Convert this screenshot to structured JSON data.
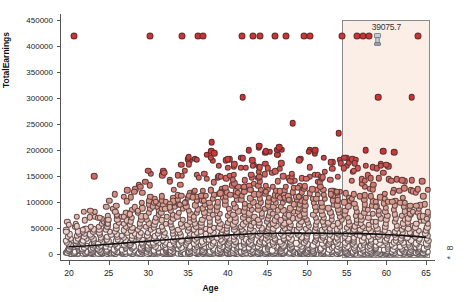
{
  "chart_data": {
    "type": "scatter",
    "title": "",
    "xlabel": "Age",
    "ylabel": "TotalEarnings",
    "xlim": [
      19.0,
      66.0
    ],
    "ylim": [
      -12000,
      462000
    ],
    "xticks": [
      20,
      25,
      30,
      35,
      40,
      45,
      50,
      55,
      60,
      65
    ],
    "xticklabels": [
      "20",
      "25",
      "30",
      "35",
      "40",
      "45",
      "50",
      "55",
      "60",
      "65"
    ],
    "yticks": [
      0,
      50000,
      100000,
      150000,
      200000,
      250000,
      300000,
      350000,
      400000,
      450000
    ],
    "yticklabels": [
      "0",
      "50000",
      "100000",
      "150000",
      "200000",
      "250000",
      "300000",
      "350000",
      "400000",
      "450000"
    ],
    "grid": false,
    "legend_position": "right-margin-clipped",
    "point_color_low": "#ffffff",
    "point_color_mid": "#d89a8d",
    "point_color_high": "#cc3333",
    "point_edge_color": "#4a3535",
    "trend_line_color": "#111111",
    "capped_value": 420000,
    "capped_points": [
      {
        "age": 20.6,
        "earnings": 420000
      },
      {
        "age": 30.2,
        "earnings": 420000
      },
      {
        "age": 34.2,
        "earnings": 420000
      },
      {
        "age": 36.2,
        "earnings": 420000
      },
      {
        "age": 36.9,
        "earnings": 420000
      },
      {
        "age": 41.8,
        "earnings": 420000
      },
      {
        "age": 43.2,
        "earnings": 420000
      },
      {
        "age": 44.1,
        "earnings": 420000
      },
      {
        "age": 46.0,
        "earnings": 420000
      },
      {
        "age": 47.3,
        "earnings": 420000
      },
      {
        "age": 49.6,
        "earnings": 420000
      },
      {
        "age": 50.4,
        "earnings": 420000
      },
      {
        "age": 54.4,
        "earnings": 420000
      },
      {
        "age": 56.3,
        "earnings": 420000
      },
      {
        "age": 57.0,
        "earnings": 420000
      },
      {
        "age": 57.8,
        "earnings": 420000
      },
      {
        "age": 64.0,
        "earnings": 420000
      }
    ],
    "high_outliers": [
      {
        "age": 23.2,
        "earnings": 150000
      },
      {
        "age": 41.9,
        "earnings": 302000
      },
      {
        "age": 59.0,
        "earnings": 302000
      },
      {
        "age": 63.2,
        "earnings": 302000
      },
      {
        "age": 48.2,
        "earnings": 252000
      },
      {
        "age": 54.0,
        "earnings": 232000
      },
      {
        "age": 38.0,
        "earnings": 215000
      },
      {
        "age": 44.0,
        "earnings": 208000
      },
      {
        "age": 46.5,
        "earnings": 205000
      },
      {
        "age": 51.0,
        "earnings": 200000
      },
      {
        "age": 57.4,
        "earnings": 200000
      },
      {
        "age": 59.6,
        "earnings": 198000
      },
      {
        "age": 61.0,
        "earnings": 196000
      },
      {
        "age": 35.1,
        "earnings": 186000
      },
      {
        "age": 40.0,
        "earnings": 182000
      },
      {
        "age": 49.0,
        "earnings": 180000
      },
      {
        "age": 53.0,
        "earnings": 176000
      },
      {
        "age": 56.0,
        "earnings": 174000
      },
      {
        "age": 60.0,
        "earnings": 172000
      },
      {
        "age": 30.0,
        "earnings": 160000
      },
      {
        "age": 32.0,
        "earnings": 156000
      },
      {
        "age": 43.0,
        "earnings": 152000
      },
      {
        "age": 47.0,
        "earnings": 150000
      },
      {
        "age": 52.0,
        "earnings": 148000
      },
      {
        "age": 58.0,
        "earnings": 146000
      },
      {
        "age": 62.0,
        "earnings": 142000
      },
      {
        "age": 64.5,
        "earnings": 140000
      }
    ],
    "trend_line": [
      {
        "age": 20.0,
        "earnings": 13500
      },
      {
        "age": 22.0,
        "earnings": 15000
      },
      {
        "age": 25.0,
        "earnings": 18500
      },
      {
        "age": 28.0,
        "earnings": 22000
      },
      {
        "age": 31.0,
        "earnings": 25500
      },
      {
        "age": 34.0,
        "earnings": 29000
      },
      {
        "age": 37.0,
        "earnings": 32500
      },
      {
        "age": 40.0,
        "earnings": 36000
      },
      {
        "age": 43.0,
        "earnings": 38500
      },
      {
        "age": 46.0,
        "earnings": 39500
      },
      {
        "age": 49.0,
        "earnings": 39800
      },
      {
        "age": 52.0,
        "earnings": 39600
      },
      {
        "age": 55.0,
        "earnings": 39200
      },
      {
        "age": 58.0,
        "earnings": 38200
      },
      {
        "age": 61.0,
        "earnings": 36200
      },
      {
        "age": 63.5,
        "earnings": 33500
      },
      {
        "age": 65.0,
        "earnings": 31500
      }
    ],
    "density_ages": [
      20,
      21,
      22,
      23,
      24,
      25,
      26,
      27,
      28,
      29,
      30,
      31,
      32,
      33,
      34,
      35,
      36,
      37,
      38,
      39,
      40,
      41,
      42,
      43,
      44,
      45,
      46,
      47,
      48,
      49,
      50,
      51,
      52,
      53,
      54,
      55,
      56,
      57,
      58,
      59,
      60,
      61,
      62,
      63,
      64,
      65
    ],
    "density_max_earnings": [
      42000,
      48000,
      54000,
      58000,
      64000,
      72000,
      80000,
      86000,
      92000,
      96000,
      104000,
      108000,
      112000,
      116000,
      122000,
      126000,
      128000,
      130000,
      132000,
      134000,
      136000,
      138000,
      138000,
      140000,
      140000,
      140000,
      138000,
      138000,
      136000,
      136000,
      134000,
      132000,
      132000,
      130000,
      128000,
      126000,
      124000,
      122000,
      120000,
      118000,
      116000,
      112000,
      108000,
      102000,
      96000,
      88000
    ]
  },
  "selection": {
    "label": "39075.7",
    "x_start_age": 54.45,
    "x_end_age": 65.55,
    "y_top": 450000,
    "y_bottom": -9000,
    "fill_color": "#fbeee7",
    "border_color": "#8a8a8a"
  },
  "cursor": {
    "icon": "drag-handle-icon",
    "age": 58.9,
    "earnings": 412000
  },
  "legend_stub": {
    "glyph_top": "8",
    "glyph_bottom": "*"
  }
}
